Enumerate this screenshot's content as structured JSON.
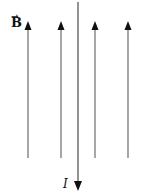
{
  "diagram": {
    "field_label": "B",
    "field_vector_mark": "→",
    "current_label": "I",
    "field_lines": [
      {
        "x": 28,
        "direction": "up"
      },
      {
        "x": 61,
        "direction": "up"
      },
      {
        "x": 95,
        "direction": "up"
      },
      {
        "x": 128,
        "direction": "up"
      }
    ],
    "wire": {
      "x": 78,
      "direction": "down"
    },
    "colors": {
      "line": "#777777",
      "arrowhead": "#111111",
      "wire": "#666666"
    }
  }
}
